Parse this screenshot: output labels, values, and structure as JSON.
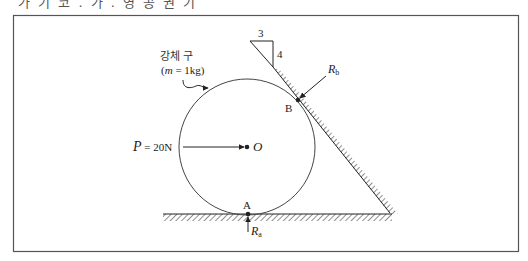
{
  "header": {
    "cut_off_text": "가 기 코 . 가 . 영 공 권 기"
  },
  "diagram": {
    "body_label": "강체 구",
    "mass_label_prefix": "(",
    "mass_var": "m",
    "mass_value": " = 1kg)",
    "force_var": "P",
    "force_value": " = 20N",
    "center_label": "O",
    "point_a": "A",
    "point_b": "B",
    "reaction_a_var": "R",
    "reaction_a_sub": "a",
    "reaction_b_var": "R",
    "reaction_b_sub": "b",
    "slope_run": "3",
    "slope_rise": "4"
  },
  "colors": {
    "line": "#222222",
    "frame": "#555555",
    "background": "#ffffff"
  }
}
